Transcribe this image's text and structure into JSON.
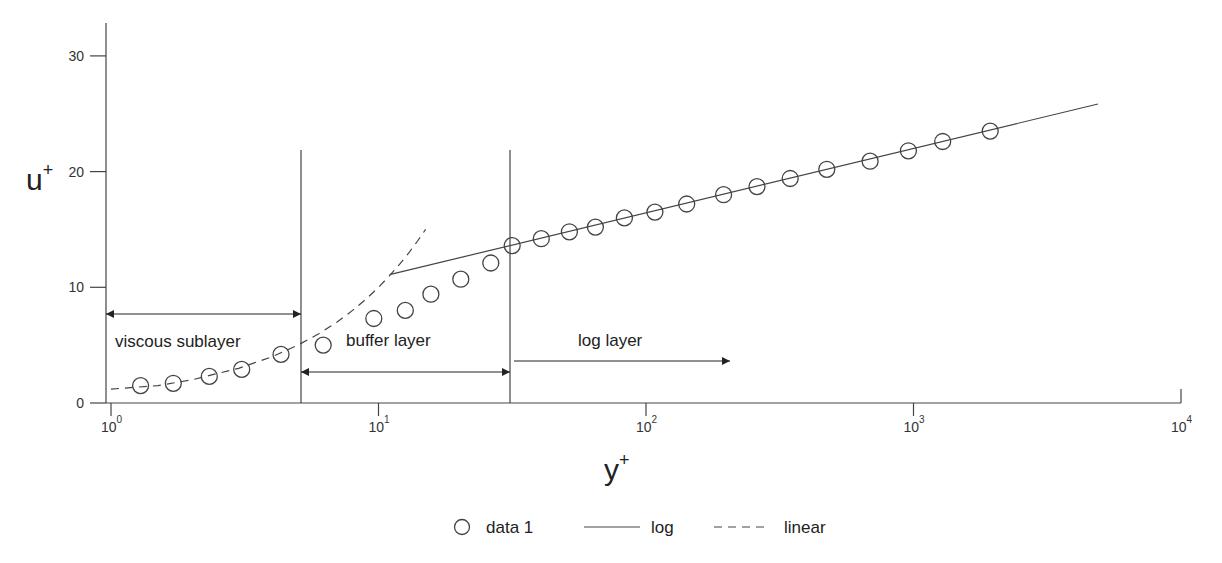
{
  "chart_data": {
    "type": "scatter",
    "title": "",
    "xlabel": "y+",
    "ylabel": "u+",
    "xlabel_base": "y",
    "ylabel_base": "u",
    "label_sup": "+",
    "xscale": "log",
    "xlim": [
      1,
      10000
    ],
    "ylim": [
      0,
      33
    ],
    "grid": false,
    "legend_position": "bottom-center",
    "x_ticks": [
      {
        "base": "10",
        "exp": "0",
        "value": 1
      },
      {
        "base": "10",
        "exp": "1",
        "value": 10
      },
      {
        "base": "10",
        "exp": "2",
        "value": 100
      },
      {
        "base": "10",
        "exp": "3",
        "value": 1000
      },
      {
        "base": "10",
        "exp": "4",
        "value": 10000
      }
    ],
    "y_ticks": [
      {
        "label": "0",
        "value": 0
      },
      {
        "label": "10",
        "value": 10
      },
      {
        "label": "20",
        "value": 20
      },
      {
        "label": "30",
        "value": 30
      }
    ],
    "series": [
      {
        "name": "data 1",
        "style": "circle-markers",
        "x": [
          1.29,
          1.71,
          2.33,
          3.08,
          4.32,
          6.21,
          9.6,
          12.6,
          15.7,
          20.3,
          26.3,
          31.6,
          40.6,
          51.7,
          64.7,
          83.0,
          108,
          142,
          195,
          260,
          346,
          474,
          688,
          957,
          1286,
          1936
        ],
        "y": [
          1.5,
          1.7,
          2.3,
          2.9,
          4.2,
          5.0,
          7.3,
          8.0,
          9.4,
          10.7,
          12.1,
          13.6,
          14.2,
          14.8,
          15.2,
          16.0,
          16.5,
          17.2,
          18.0,
          18.7,
          19.4,
          20.2,
          20.9,
          21.8,
          22.6,
          23.5
        ]
      },
      {
        "name": "log",
        "style": "solid-line",
        "equation": "u+ = 2.44 ln(y+) + 5.5",
        "x": [
          11,
          5000
        ],
        "y": [
          11.1,
          26.3
        ]
      },
      {
        "name": "linear",
        "style": "dashed-line",
        "equation": "u+ = y+",
        "x": [
          1,
          1.5,
          2,
          3,
          4,
          5,
          6,
          7,
          8,
          9,
          10,
          11,
          12,
          13,
          14,
          15
        ],
        "y": [
          1.2,
          1.5,
          2.0,
          3.0,
          4.0,
          5.0,
          6.0,
          7.0,
          8.0,
          9.0,
          10.0,
          11.0,
          12.0,
          13.0,
          14.0,
          15.0
        ]
      }
    ],
    "annotations": [
      {
        "type": "vline",
        "x": 5.3,
        "y_top": 22
      },
      {
        "type": "vline",
        "x": 30.5,
        "y_top": 22
      },
      {
        "type": "double-arrow",
        "label": "viscous sublayer",
        "x_from": 1,
        "x_to": 5.3,
        "y": 7.6
      },
      {
        "type": "double-arrow",
        "label": "buffer layer",
        "x_from": 5.3,
        "x_to": 30.5,
        "y": 2.7
      },
      {
        "type": "right-arrow",
        "label": "log layer",
        "x_from": 32,
        "x_to": 200,
        "y": 3.6
      }
    ]
  },
  "legend": {
    "items": [
      {
        "label": "data 1",
        "symbol": "circle"
      },
      {
        "label": "log",
        "symbol": "solid-line"
      },
      {
        "label": "linear",
        "symbol": "dashed-line"
      }
    ]
  },
  "region_labels": {
    "viscous": "viscous sublayer",
    "buffer": "buffer layer",
    "log": "log layer"
  },
  "colors": {
    "ink": "#444444",
    "text": "#222222",
    "background": "#ffffff"
  }
}
